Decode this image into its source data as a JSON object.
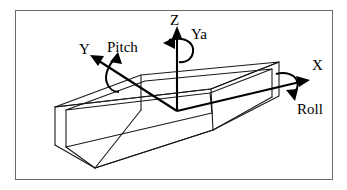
{
  "figure": {
    "background_color": "#ffffff",
    "frame_color": "#6b6b6b",
    "line_color": "#1a1a1a",
    "axis_color": "#000000"
  },
  "axes": [
    {
      "id": "z",
      "label": "Z",
      "direction": "up",
      "rotation": {
        "name": "Ya",
        "label": "Ya",
        "meaning": "yaw"
      }
    },
    {
      "id": "y",
      "label": "Y",
      "direction": "up-left",
      "rotation": {
        "name": "Pitch",
        "label": "Pitch",
        "meaning": "pitch"
      }
    },
    {
      "id": "x",
      "label": "X",
      "direction": "right",
      "rotation": {
        "name": "Roll",
        "label": "Roll",
        "meaning": "roll"
      }
    }
  ],
  "labels": {
    "z_axis": "Z",
    "y_axis": "Y",
    "x_axis": "X",
    "yaw": "Ya",
    "pitch": "Pitch",
    "roll": "Roll"
  },
  "body": {
    "shape": "rectangular-prism",
    "description": "elongated open box drawn in oblique projection"
  }
}
